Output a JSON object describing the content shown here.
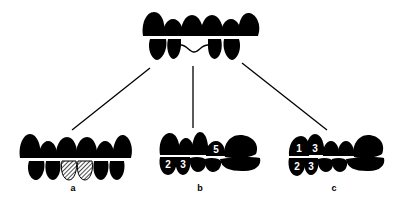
{
  "figure": {
    "top": {
      "description": "Dental arch with missing lower teeth; gap bridged by wavy line",
      "upper_teeth": 6,
      "lower_teeth": 4
    },
    "panels": [
      {
        "label": "a",
        "description": "Two lower teeth hatched (replacement)",
        "numbers": []
      },
      {
        "label": "b",
        "description": "Adjacent teeth shifted",
        "numbers": [
          "2",
          "3",
          "5"
        ]
      },
      {
        "label": "c",
        "description": "Teeth tilted/extruded",
        "numbers": [
          "1",
          "3",
          "2",
          "3"
        ]
      }
    ]
  },
  "colors": {
    "teeth": "#000000",
    "background": "#ffffff"
  }
}
